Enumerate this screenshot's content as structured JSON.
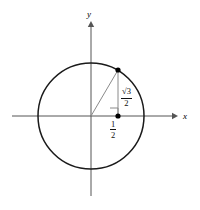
{
  "figure": {
    "type": "unit-circle-diagram",
    "title": "",
    "background_color": "#ffffff",
    "line_color": "#1a1a1a",
    "axis_color": "#555555",
    "thin_line_color": "#888888"
  },
  "axes": {
    "x_axis": {
      "label": "x",
      "arrow": "right",
      "start_x": 12,
      "end_x": 176,
      "y": 116
    },
    "y_axis": {
      "label": "y",
      "arrow": "up",
      "start_y": 196,
      "end_y": 22,
      "x": 91
    }
  },
  "circle": {
    "center_x": 91,
    "center_y": 116,
    "radius": 53,
    "stroke_width": 1.4
  },
  "point": {
    "name": "point-on-circle",
    "x": 118,
    "y": 70,
    "radius": 2.6,
    "coordinates_label": "(1/2, √3/2)"
  },
  "foot_point": {
    "name": "foot-of-perpendicular",
    "x": 118,
    "y": 116,
    "radius": 2.6
  },
  "right_angle_marker": {
    "size": 8,
    "corner_x": 118,
    "corner_y": 116
  },
  "labels": {
    "x_label": "x",
    "y_label": "y",
    "vertical_leg": {
      "name": "sqrt3-over-2",
      "numerator": "√3",
      "denominator": "2",
      "numerator_plain": "3",
      "radical_symbol": "√"
    },
    "horizontal_leg": {
      "name": "one-half",
      "numerator": "1",
      "denominator": "2"
    }
  }
}
